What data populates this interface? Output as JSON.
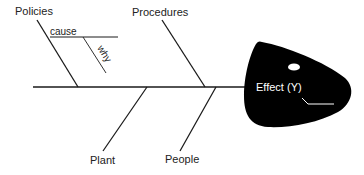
{
  "diagram": {
    "type": "fishbone",
    "effect": {
      "label": "Effect (Y)"
    },
    "categories": [
      {
        "label": "Policies",
        "position": "top"
      },
      {
        "label": "Procedures",
        "position": "top"
      },
      {
        "label": "Plant",
        "position": "bottom"
      },
      {
        "label": "People",
        "position": "bottom"
      }
    ],
    "sub_branch": {
      "cause_label": "cause",
      "why_label": "why"
    },
    "colors": {
      "line": "#1a1a1a",
      "head": "#000000",
      "effect_text": "#ffffff",
      "label_text": "#222222"
    }
  }
}
